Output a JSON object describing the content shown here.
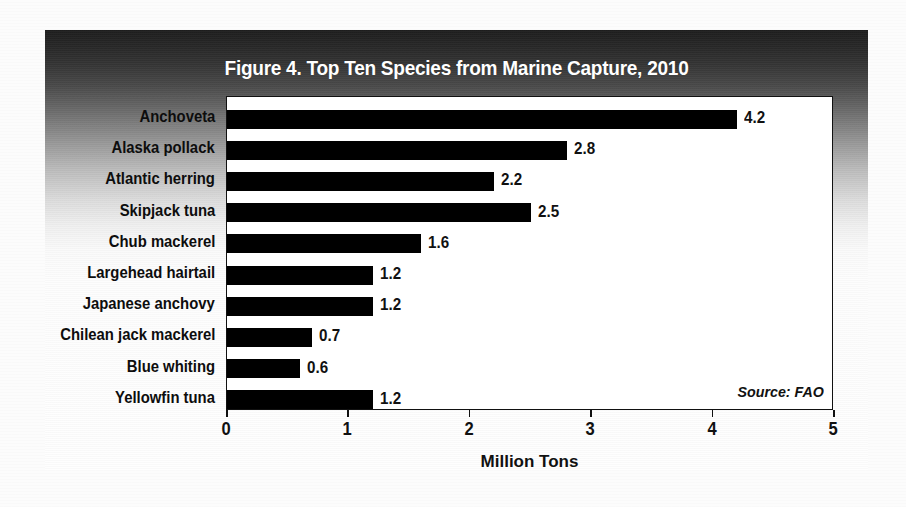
{
  "figure": {
    "title": "Figure 4. Top Ten Species from Marine Capture, 2010",
    "source_note": "Source: FAO"
  },
  "chart_data": {
    "type": "bar",
    "orientation": "horizontal",
    "title": "Figure 4. Top Ten Species from Marine Capture, 2010",
    "xlabel": "Million Tons",
    "ylabel": "",
    "xlim": [
      0,
      5
    ],
    "xticks": [
      "0",
      "1",
      "2",
      "3",
      "4",
      "5"
    ],
    "grid": false,
    "legend": null,
    "annotation": "Source: FAO",
    "bar_color": "#000000",
    "categories": [
      "Anchoveta",
      "Alaska pollack",
      "Atlantic herring",
      "Skipjack tuna",
      "Chub mackerel",
      "Largehead hairtail",
      "Japanese anchovy",
      "Chilean jack mackerel",
      "Blue whiting",
      "Yellowfin tuna"
    ],
    "values": [
      4.2,
      2.8,
      2.2,
      2.5,
      1.6,
      1.2,
      1.2,
      0.7,
      0.6,
      1.2
    ],
    "value_labels": [
      "4.2",
      "2.8",
      "2.2",
      "2.5",
      "1.6",
      "1.2",
      "1.2",
      "0.7",
      "0.6",
      "1.2"
    ]
  }
}
